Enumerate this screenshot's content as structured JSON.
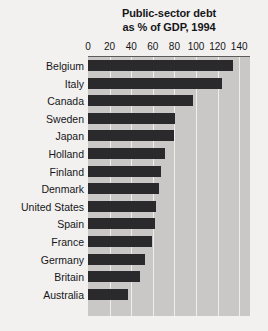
{
  "chart_data": {
    "type": "bar",
    "orientation": "horizontal",
    "title": "Public-sector debt as % of GDP, 1994",
    "title_lines": [
      "Public-sector debt",
      "as % of GDP, 1994"
    ],
    "xlabel": "",
    "ylabel": "",
    "xlim": [
      0,
      150
    ],
    "xticks": [
      0,
      20,
      40,
      60,
      80,
      100,
      120,
      140
    ],
    "xtick_labels": [
      "0",
      "20",
      "40",
      "60",
      "80",
      "100",
      "120",
      "140"
    ],
    "grid": "vertical",
    "legend": "none",
    "categories": [
      "Belgium",
      "Italy",
      "Canada",
      "Sweden",
      "Japan",
      "Holland",
      "Finland",
      "Denmark",
      "United States",
      "Spain",
      "France",
      "Germany",
      "Britain",
      "Australia"
    ],
    "values": [
      134,
      124,
      97,
      81,
      80,
      71,
      68,
      66,
      63,
      62,
      59,
      53,
      48,
      37
    ],
    "colors": {
      "bar": "#2a2a2c",
      "plot_background": "#c9c8c6",
      "page_background": "#f2f1ef",
      "gridline": "#efeeec",
      "axis_rule": "#5d5d5d",
      "text": "#16161a"
    }
  }
}
